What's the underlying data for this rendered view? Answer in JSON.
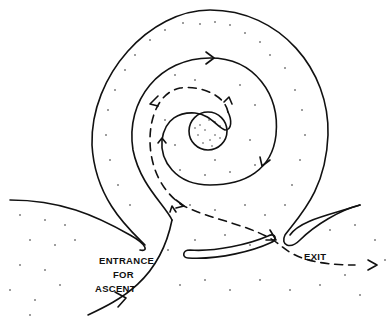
{
  "diagram": {
    "title": "",
    "labels": {
      "entrance_line1": "ENTRANCE",
      "entrance_line2": "FOR",
      "entrance_line3": "ASCENT",
      "exit": "EXIT"
    },
    "colors": {
      "background": "#ffffff",
      "ink": "#111111"
    }
  }
}
